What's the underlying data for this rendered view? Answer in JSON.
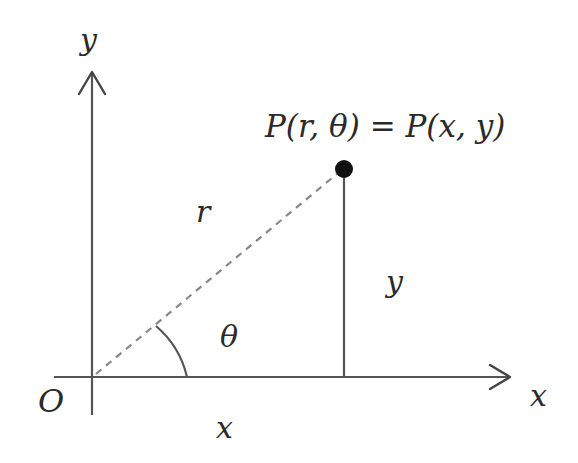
{
  "diagram": {
    "labels": {
      "y_axis": "y",
      "x_axis": "x",
      "origin": "O",
      "radius": "r",
      "angle": "θ",
      "x_projection": "x",
      "y_projection": "y",
      "point": "P(r, θ) = P(x, y)"
    },
    "colors": {
      "axis": "#555555",
      "dashed_line": "#888888",
      "point": "#111111",
      "text": "#2a2a2a",
      "background": "#ffffff"
    },
    "elements": {
      "origin": [
        92,
        377
      ],
      "point_P": [
        344,
        169
      ],
      "x_axis_end": [
        510,
        377
      ],
      "y_axis_top": [
        92,
        72
      ],
      "angle_arc_radius": 95
    }
  }
}
